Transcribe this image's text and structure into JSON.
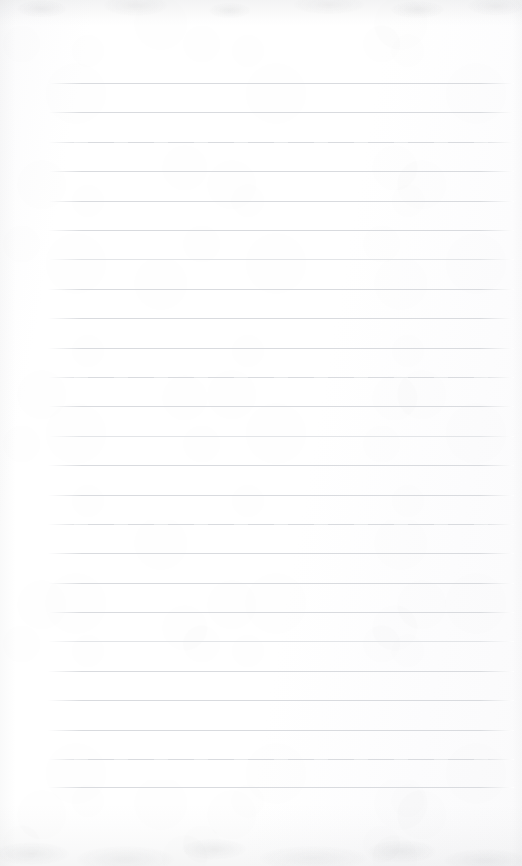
{
  "document": {
    "kind": "scanned-blank-lined-page",
    "title": "Blank ruled notebook page",
    "page_width": 522,
    "page_height": 866,
    "background_color": "#fefefe",
    "has_text_content": false,
    "written_content": "",
    "header_text": "",
    "footer_text": "",
    "page_number": ""
  },
  "ruling": {
    "line_color": "#d9dbdf",
    "line_thickness_px": 1,
    "line_count": 25,
    "line_left_x": 48,
    "line_right_x": 514,
    "line_length_px": 466,
    "first_line_y": 83,
    "last_line_y": 787,
    "line_spacing_px": 29.33,
    "style": "horizontal-ruled",
    "lines": [
      {
        "index": 1,
        "y": 83,
        "variant": "normal"
      },
      {
        "index": 2,
        "y": 112,
        "variant": "normal"
      },
      {
        "index": 3,
        "y": 142,
        "variant": "patchy"
      },
      {
        "index": 4,
        "y": 171,
        "variant": "normal"
      },
      {
        "index": 5,
        "y": 201,
        "variant": "normal"
      },
      {
        "index": 6,
        "y": 230,
        "variant": "normal"
      },
      {
        "index": 7,
        "y": 259,
        "variant": "faint"
      },
      {
        "index": 8,
        "y": 289,
        "variant": "normal"
      },
      {
        "index": 9,
        "y": 318,
        "variant": "normal"
      },
      {
        "index": 10,
        "y": 348,
        "variant": "normal"
      },
      {
        "index": 11,
        "y": 377,
        "variant": "patchy"
      },
      {
        "index": 12,
        "y": 406,
        "variant": "normal"
      },
      {
        "index": 13,
        "y": 436,
        "variant": "faint"
      },
      {
        "index": 14,
        "y": 465,
        "variant": "normal"
      },
      {
        "index": 15,
        "y": 495,
        "variant": "normal"
      },
      {
        "index": 16,
        "y": 524,
        "variant": "patchy"
      },
      {
        "index": 17,
        "y": 553,
        "variant": "normal"
      },
      {
        "index": 18,
        "y": 583,
        "variant": "normal"
      },
      {
        "index": 19,
        "y": 612,
        "variant": "normal"
      },
      {
        "index": 20,
        "y": 641,
        "variant": "faint"
      },
      {
        "index": 21,
        "y": 671,
        "variant": "normal"
      },
      {
        "index": 22,
        "y": 700,
        "variant": "normal"
      },
      {
        "index": 23,
        "y": 730,
        "variant": "normal"
      },
      {
        "index": 24,
        "y": 759,
        "variant": "patchy"
      },
      {
        "index": 25,
        "y": 787,
        "variant": "normal"
      }
    ]
  },
  "scan_artifacts": {
    "top_edge_shading_color": "#787c82",
    "bottom_edge_shading_color": "#70747a",
    "left_edge_shading_color": "#787c82",
    "right_edge_shading_color": "#787c82",
    "top_band_height_px": 26,
    "bottom_band_height_px": 62,
    "texture": "mottled-paper-grain"
  }
}
